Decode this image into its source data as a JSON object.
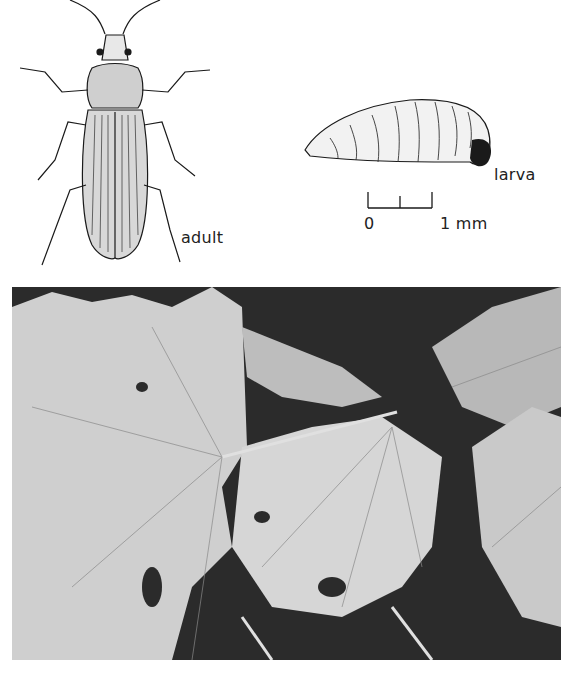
{
  "figure": {
    "labels": {
      "adult": "adult",
      "larva": "larva"
    },
    "scale_bar": {
      "start": "0",
      "end": "1 mm"
    },
    "illustrations": [
      {
        "subject": "adult weevil beetle, dorsal view",
        "icon": "beetle-drawing"
      },
      {
        "subject": "larva, lateral view",
        "icon": "larva-drawing"
      }
    ],
    "photo": {
      "subject": "damaged leaves with serrated edges and holes",
      "style": "black-and-white photograph"
    },
    "caption": ""
  },
  "colors": {
    "ink": "#1a1a1a",
    "paper": "#ffffff",
    "photo_dark": "#2b2b2b",
    "leaf_light": "#d9d9d9"
  }
}
